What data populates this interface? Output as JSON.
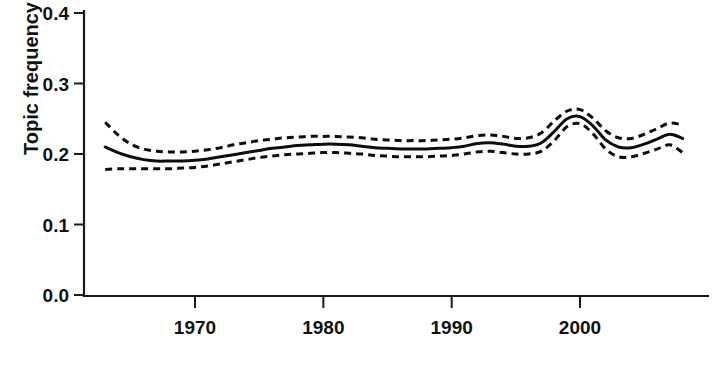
{
  "figure": {
    "background_color": "#ffffff",
    "line_color": "#0d0d0d"
  },
  "axes": {
    "y_title": "Topic frequency",
    "x_title": "",
    "y_ticks": [
      "0.0",
      "0.1",
      "0.2",
      "0.3",
      "0.4"
    ],
    "x_ticks": [
      "1970",
      "1980",
      "1990",
      "2000"
    ]
  },
  "chart_data": {
    "type": "line",
    "title": "",
    "xlabel": "",
    "ylabel": "Topic frequency",
    "xlim": [
      1963,
      2008
    ],
    "ylim": [
      0.0,
      0.4
    ],
    "grid": false,
    "legend": "none",
    "x_tick_values": [
      1970,
      1980,
      1990,
      2000
    ],
    "y_tick_values": [
      0.0,
      0.1,
      0.2,
      0.3,
      0.4
    ],
    "x": [
      1963,
      1964,
      1965,
      1966,
      1967,
      1968,
      1969,
      1970,
      1971,
      1972,
      1973,
      1974,
      1975,
      1976,
      1977,
      1978,
      1979,
      1980,
      1981,
      1982,
      1983,
      1984,
      1985,
      1986,
      1987,
      1988,
      1989,
      1990,
      1991,
      1992,
      1993,
      1994,
      1995,
      1996,
      1997,
      1998,
      1999,
      2000,
      2001,
      2002,
      2003,
      2004,
      2005,
      2006,
      2007,
      2008
    ],
    "series": [
      {
        "name": "Topic frequency (smoothed mean)",
        "style": "solid",
        "values": [
          0.21,
          0.202,
          0.196,
          0.192,
          0.19,
          0.19,
          0.19,
          0.191,
          0.193,
          0.196,
          0.199,
          0.202,
          0.205,
          0.208,
          0.21,
          0.212,
          0.213,
          0.214,
          0.214,
          0.213,
          0.211,
          0.209,
          0.208,
          0.207,
          0.207,
          0.207,
          0.208,
          0.209,
          0.211,
          0.215,
          0.216,
          0.214,
          0.211,
          0.211,
          0.216,
          0.232,
          0.25,
          0.253,
          0.24,
          0.22,
          0.21,
          0.209,
          0.214,
          0.221,
          0.228,
          0.222
        ]
      },
      {
        "name": "Upper confidence bound",
        "style": "dashed",
        "values": [
          0.245,
          0.227,
          0.214,
          0.207,
          0.204,
          0.203,
          0.203,
          0.204,
          0.206,
          0.209,
          0.213,
          0.216,
          0.219,
          0.221,
          0.223,
          0.224,
          0.225,
          0.225,
          0.225,
          0.224,
          0.223,
          0.221,
          0.22,
          0.219,
          0.219,
          0.219,
          0.22,
          0.221,
          0.223,
          0.226,
          0.227,
          0.225,
          0.222,
          0.223,
          0.23,
          0.247,
          0.261,
          0.263,
          0.251,
          0.233,
          0.223,
          0.222,
          0.228,
          0.236,
          0.244,
          0.241
        ]
      },
      {
        "name": "Lower confidence bound",
        "style": "dashed",
        "values": [
          0.178,
          0.179,
          0.179,
          0.179,
          0.179,
          0.179,
          0.18,
          0.181,
          0.183,
          0.186,
          0.189,
          0.192,
          0.195,
          0.197,
          0.199,
          0.2,
          0.201,
          0.202,
          0.202,
          0.201,
          0.2,
          0.198,
          0.197,
          0.196,
          0.196,
          0.196,
          0.197,
          0.198,
          0.2,
          0.203,
          0.204,
          0.202,
          0.2,
          0.2,
          0.204,
          0.219,
          0.239,
          0.243,
          0.229,
          0.207,
          0.196,
          0.196,
          0.201,
          0.207,
          0.213,
          0.202
        ]
      }
    ]
  }
}
